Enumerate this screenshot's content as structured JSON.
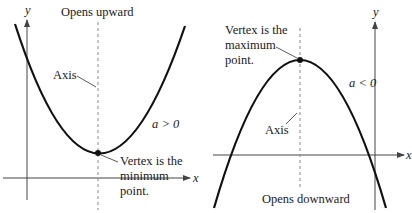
{
  "figure": {
    "left_panel": {
      "title": "Opens upward",
      "condition": "a > 0",
      "axis_label": "Axis",
      "vertex_label": [
        "Vertex is the",
        "minimum",
        "point."
      ],
      "x_axis_label": "x",
      "y_axis_label": "y"
    },
    "right_panel": {
      "title": "Opens downward",
      "condition": "a < 0",
      "axis_label": "Axis",
      "vertex_label": [
        "Vertex is the",
        "maximum",
        "point."
      ],
      "x_axis_label": "x",
      "y_axis_label": "y"
    }
  },
  "colors": {
    "curve": "#111111",
    "axes": "#444444",
    "symmetry_axis": "#888888",
    "text": "#1a1a1a",
    "background": "#ffffff"
  }
}
